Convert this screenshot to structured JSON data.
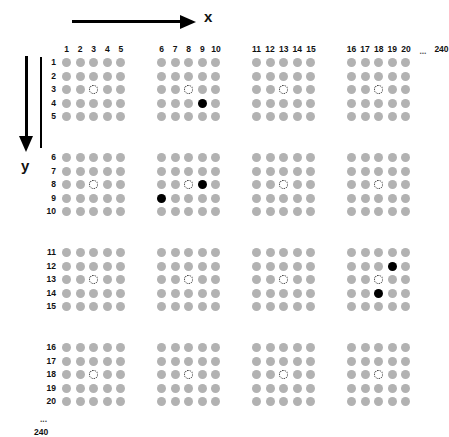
{
  "figure": {
    "x_axis_label": "x",
    "y_axis_label": "y",
    "column_headers": [
      "1",
      "2",
      "3",
      "4",
      "5",
      "6",
      "7",
      "8",
      "9",
      "10",
      "11",
      "12",
      "13",
      "14",
      "15",
      "16",
      "17",
      "18",
      "19",
      "20"
    ],
    "column_ellipsis": "...",
    "column_tail_label": "240",
    "row_labels": [
      "1",
      "2",
      "3",
      "4",
      "5",
      "6",
      "7",
      "8",
      "9",
      "10",
      "11",
      "12",
      "13",
      "14",
      "15",
      "16",
      "17",
      "18",
      "19",
      "20"
    ],
    "row_ellipsis": "...",
    "row_tail_label": "240",
    "caption_partial": "",
    "colors": {
      "dot_gray": "#b2b2b2",
      "dot_black": "#000000",
      "dot_white": "#ffffff",
      "outline": "#1a1a1a",
      "axis": "#000000",
      "background": "#ffffff"
    }
  },
  "chart_data": {
    "type": "scatter",
    "title": "",
    "xlabel": "x",
    "ylabel": "y",
    "xlim": [
      1,
      20
    ],
    "ylim": [
      1,
      20
    ],
    "grid": false,
    "legend": [
      {
        "name": "ordinary site",
        "marker": "filled-gray-circle",
        "color": "#b2b2b2"
      },
      {
        "name": "open site",
        "marker": "open-white-circle",
        "color": "#ffffff"
      },
      {
        "name": "marked site",
        "marker": "filled-black-circle",
        "color": "#000000"
      }
    ],
    "block_cols": [
      [
        1,
        5
      ],
      [
        6,
        10
      ],
      [
        11,
        15
      ],
      [
        16,
        20
      ]
    ],
    "block_rows": [
      [
        1,
        5
      ],
      [
        6,
        10
      ],
      [
        11,
        15
      ],
      [
        16,
        20
      ]
    ],
    "states": {
      "gray": "default",
      "white": "open",
      "black": "marked"
    },
    "white_points": [
      {
        "x": 3,
        "y": 3
      },
      {
        "x": 8,
        "y": 3
      },
      {
        "x": 13,
        "y": 3
      },
      {
        "x": 18,
        "y": 3
      },
      {
        "x": 3,
        "y": 8
      },
      {
        "x": 8,
        "y": 8
      },
      {
        "x": 13,
        "y": 8
      },
      {
        "x": 18,
        "y": 8
      },
      {
        "x": 3,
        "y": 13
      },
      {
        "x": 8,
        "y": 13
      },
      {
        "x": 13,
        "y": 13
      },
      {
        "x": 18,
        "y": 13
      },
      {
        "x": 3,
        "y": 18
      },
      {
        "x": 8,
        "y": 18
      },
      {
        "x": 13,
        "y": 18
      },
      {
        "x": 18,
        "y": 18
      }
    ],
    "black_points": [
      {
        "x": 9,
        "y": 4
      },
      {
        "x": 9,
        "y": 8
      },
      {
        "x": 6,
        "y": 9
      },
      {
        "x": 19,
        "y": 12
      },
      {
        "x": 18,
        "y": 14
      }
    ]
  }
}
